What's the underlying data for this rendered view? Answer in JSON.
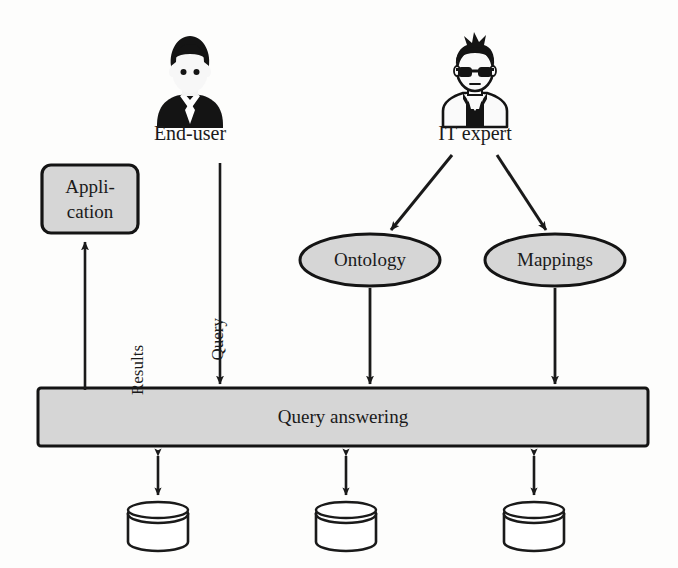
{
  "figure": {
    "background_color": "#fdfdfc",
    "fill_gray": "#d4d4d4",
    "stroke_color": "#1a1a1a"
  },
  "actors": [
    {
      "id": "end-user",
      "label": "End-user",
      "icon": "person-suit-avatar-icon",
      "x": 190,
      "y": 80
    },
    {
      "id": "it-expert",
      "label": "IT expert",
      "icon": "person-glasses-avatar-icon",
      "x": 475,
      "y": 80
    }
  ],
  "nodes": [
    {
      "id": "application",
      "shape": "rounded-rect",
      "label_line1": "Appli-",
      "label_line2": "cation",
      "x": 42,
      "y": 165,
      "w": 96,
      "h": 68
    },
    {
      "id": "ontology",
      "shape": "ellipse",
      "label": "Ontology",
      "cx": 370,
      "cy": 260,
      "rx": 70,
      "ry": 26
    },
    {
      "id": "mappings",
      "shape": "ellipse",
      "label": "Mappings",
      "cx": 555,
      "cy": 260,
      "rx": 70,
      "ry": 26
    },
    {
      "id": "query-answering",
      "shape": "rect",
      "label": "Query answering",
      "x": 38,
      "y": 388,
      "w": 610,
      "h": 58
    }
  ],
  "datasources": [
    {
      "id": "datasource-1",
      "label": "",
      "cx": 158,
      "cy": 527
    },
    {
      "id": "datasource-2",
      "label": "",
      "cx": 346,
      "cy": 527
    },
    {
      "id": "datasource-3",
      "label": "",
      "cx": 534,
      "cy": 527
    }
  ],
  "edges": [
    {
      "id": "results-edge",
      "label": "Results",
      "from": "query-answering",
      "to": "application",
      "direction": "up",
      "label_x": 128,
      "label_y": 345
    },
    {
      "id": "query-edge",
      "label": "Query",
      "from": "end-user",
      "to": "query-answering",
      "direction": "down",
      "label_x": 208,
      "label_y": 318
    },
    {
      "id": "it-expert-to-ontology-edge",
      "label": "",
      "from": "it-expert",
      "to": "ontology",
      "direction": "down-left"
    },
    {
      "id": "it-expert-to-mappings-edge",
      "label": "",
      "from": "it-expert",
      "to": "mappings",
      "direction": "down-right"
    },
    {
      "id": "ontology-to-query-answering-edge",
      "label": "",
      "from": "ontology",
      "to": "query-answering",
      "direction": "down"
    },
    {
      "id": "mappings-to-query-answering-edge",
      "label": "",
      "from": "mappings",
      "to": "query-answering",
      "direction": "down"
    },
    {
      "id": "query-answering-to-datasource-1-edge",
      "label": "",
      "from": "query-answering",
      "to": "datasource-1",
      "direction": "bidirectional"
    },
    {
      "id": "query-answering-to-datasource-2-edge",
      "label": "",
      "from": "query-answering",
      "to": "datasource-2",
      "direction": "bidirectional"
    },
    {
      "id": "query-answering-to-datasource-3-edge",
      "label": "",
      "from": "query-answering",
      "to": "datasource-3",
      "direction": "bidirectional"
    }
  ]
}
